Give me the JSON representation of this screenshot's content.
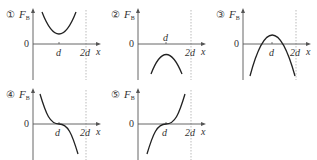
{
  "figure": {
    "axis": {
      "y_label_main": "F",
      "y_label_sub": "B",
      "x_label": "x",
      "origin_label": "0",
      "tick_d": "d",
      "tick_2d": "2d"
    },
    "colors": {
      "curve": "#222222",
      "axis": "#555555",
      "dashed": "#aaaaaa"
    },
    "panels": [
      {
        "number": "①",
        "shape": "upward parabola, vertex at x=d above axis (minimum positive)"
      },
      {
        "number": "②",
        "shape": "downward parabola, vertex at x=d below axis (maximum negative)"
      },
      {
        "number": "③",
        "shape": "downward parabola, vertex at x=d above axis, crosses zero twice"
      },
      {
        "number": "④",
        "shape": "decreasing cubic, inflection at (d, 0)"
      },
      {
        "number": "⑤",
        "shape": "increasing cubic, inflection at (d, 0)"
      }
    ]
  }
}
